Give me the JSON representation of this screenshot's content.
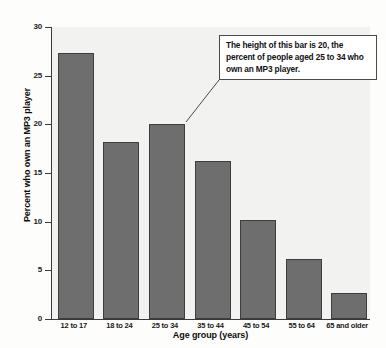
{
  "chart_data": {
    "type": "bar",
    "title": "",
    "subtitle": "",
    "xlabel": "Age group (years)",
    "ylabel": "Percent who own an MP3 player",
    "categories": [
      "12 to 17",
      "18 to 24",
      "25 to 34",
      "35 to 44",
      "45 to 54",
      "55 to 64",
      "65 and older"
    ],
    "values": [
      27.3,
      18.2,
      20.0,
      16.2,
      10.2,
      6.2,
      2.7
    ],
    "ylim": [
      0,
      30
    ],
    "yticks": [
      0,
      5,
      10,
      15,
      20,
      25,
      30
    ],
    "ytick_labels": [
      "0",
      "5",
      "10",
      "15",
      "20",
      "25",
      "30"
    ],
    "grid": false,
    "legend": "none",
    "bar_color": "#6e6e6e",
    "bar_border_color": "#3d3d3d",
    "plot_background": "#f2f2f0",
    "annotations": [
      {
        "text": "The height of this bar is 20, the percent of people aged 25 to 34 who own an MP3 player.",
        "points_to_category": "25 to 34",
        "points_to_value": 20.0
      }
    ]
  }
}
